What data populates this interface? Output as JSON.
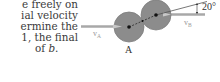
{
  "text": {
    "lines": [
      "e freely on",
      "ial velocity",
      "ermine the",
      "1, the final",
      "of "
    ],
    "last_line_italic": "b",
    "last_line_suffix": "."
  },
  "figure": {
    "ball_a_label": "A",
    "velocity_a_label": "v",
    "velocity_a_subscript": "A",
    "velocity_b_label": "v",
    "velocity_b_subscript": "B",
    "angle_label": "20°",
    "colors": {
      "ball_fill": "#8c8c8c",
      "ball_stroke": "#7a7a7a",
      "velocity_line": "#a8a8a8",
      "angle_line": "#555555"
    }
  }
}
